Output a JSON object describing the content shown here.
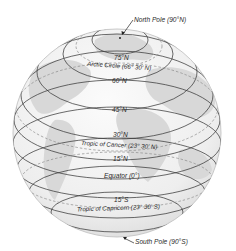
{
  "diagram": {
    "colors": {
      "ocean": "#f2f2f2",
      "land": "#d9d9d9",
      "line": "#3a3a3a",
      "dashed": "#8a8a8a",
      "text": "#2a2a2a"
    },
    "labels": {
      "north_pole": "North Pole (90°N)",
      "lat_75n": "75°N",
      "arctic_circle": "Arctic Circle (66° 30' N)",
      "lat_60n": "60°N",
      "lat_45n": "45°N",
      "lat_30n": "30°N",
      "tropic_cancer": "Tropic of Cancer (23° 30' N)",
      "lat_15n": "15°N",
      "equator": "Equator (0°)",
      "lat_15s": "15°S",
      "tropic_capricorn": "Tropic of Capricorn (23° 30' S)",
      "south_pole": "South Pole (90°S)"
    }
  }
}
